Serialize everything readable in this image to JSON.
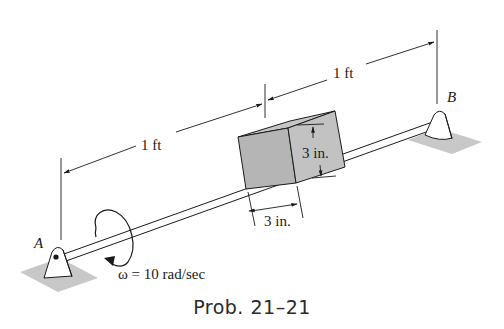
{
  "figure": {
    "caption": "Prob. 21–21",
    "labels": {
      "support_a": "A",
      "support_b": "B",
      "dim_left": "1 ft",
      "dim_right": "1 ft",
      "block_height": "3 in.",
      "block_width": "3 in.",
      "angular_velocity": "ω = 10 rad/sec"
    },
    "colors": {
      "line": "#1a1a1a",
      "block_fill": "#b5b5b5",
      "block_side_fill": "#c2c2c2",
      "ground_fill": "#c8c8c8",
      "background": "#ffffff"
    }
  }
}
